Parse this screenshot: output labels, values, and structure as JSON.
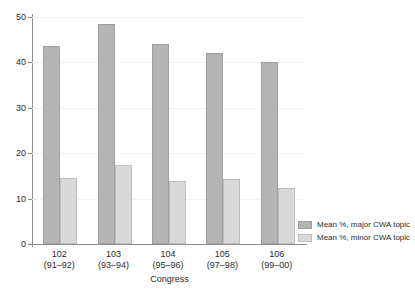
{
  "chart_data": {
    "type": "bar",
    "title": "",
    "xlabel": "Congress",
    "ylabel": "",
    "ylim": [
      0,
      50
    ],
    "yticks": [
      0,
      10,
      20,
      30,
      40,
      50
    ],
    "ytick_labels": [
      "0",
      "10",
      "20",
      "30",
      "40",
      "50"
    ],
    "grid": true,
    "legend_position": "bottom-right",
    "categories": [
      "102\n(91–92)",
      "103\n(93–94)",
      "104\n(95–96)",
      "105\n(97–98)",
      "106\n(99–00)"
    ],
    "category_lines": [
      {
        "top": "102",
        "bottom": "(91–92)"
      },
      {
        "top": "103",
        "bottom": "(93–94)"
      },
      {
        "top": "104",
        "bottom": "(95–96)"
      },
      {
        "top": "105",
        "bottom": "(97–98)"
      },
      {
        "top": "106",
        "bottom": "(99–00)"
      }
    ],
    "series": [
      {
        "name": "Mean %, major CWA topic",
        "color": "#b5b5b5",
        "values": [
          43.6,
          48.4,
          44.1,
          42.0,
          40.2
        ]
      },
      {
        "name": "Mean %, minor CWA topic",
        "color": "#d9d9d9",
        "values": [
          14.6,
          17.3,
          13.8,
          14.4,
          12.4
        ]
      }
    ]
  },
  "colors": {
    "major_bar": "#b5b5b5",
    "minor_bar": "#d9d9d9",
    "axis": "#8c8c8c",
    "grid": "#f2f2f2",
    "text": "#2b2b2b",
    "background": "#ffffff"
  }
}
